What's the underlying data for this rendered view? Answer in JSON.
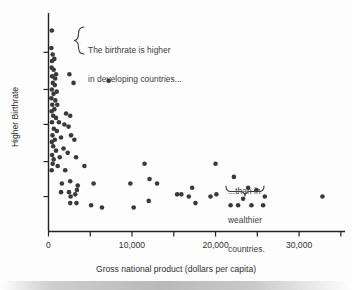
{
  "chart_data": {
    "type": "scatter",
    "title": "",
    "xlabel": "Gross national product (dollars per capita)",
    "ylabel": "Higher Birthrate",
    "xlim": [
      0,
      35500
    ],
    "ylim": [
      0,
      100
    ],
    "grid": false,
    "legend": null,
    "xticks": [
      {
        "value": 0,
        "label": "0"
      },
      {
        "value": 5000,
        "label": ""
      },
      {
        "value": 10000,
        "label": "10,000"
      },
      {
        "value": 15000,
        "label": ""
      },
      {
        "value": 20000,
        "label": "20,000"
      },
      {
        "value": 25000,
        "label": ""
      },
      {
        "value": 30000,
        "label": "30,000"
      },
      {
        "value": 35000,
        "label": ""
      }
    ],
    "yticks": [
      {
        "value": 16,
        "label": ""
      },
      {
        "value": 32,
        "label": ""
      },
      {
        "value": 49,
        "label": ""
      },
      {
        "value": 65,
        "label": ""
      },
      {
        "value": 82,
        "label": ""
      }
    ],
    "marker_color": "#3a3a3a",
    "marker_size": 4.6,
    "points": [
      {
        "x": 400,
        "y": 92
      },
      {
        "x": 350,
        "y": 84
      },
      {
        "x": 500,
        "y": 81
      },
      {
        "x": 420,
        "y": 78
      },
      {
        "x": 700,
        "y": 79
      },
      {
        "x": 380,
        "y": 75
      },
      {
        "x": 620,
        "y": 74
      },
      {
        "x": 900,
        "y": 72
      },
      {
        "x": 430,
        "y": 71
      },
      {
        "x": 800,
        "y": 70
      },
      {
        "x": 2500,
        "y": 72
      },
      {
        "x": 520,
        "y": 68
      },
      {
        "x": 760,
        "y": 67
      },
      {
        "x": 400,
        "y": 65
      },
      {
        "x": 980,
        "y": 64
      },
      {
        "x": 3000,
        "y": 68
      },
      {
        "x": 7200,
        "y": 69
      },
      {
        "x": 600,
        "y": 63
      },
      {
        "x": 350,
        "y": 61
      },
      {
        "x": 820,
        "y": 60
      },
      {
        "x": 450,
        "y": 58
      },
      {
        "x": 1050,
        "y": 58
      },
      {
        "x": 700,
        "y": 56
      },
      {
        "x": 380,
        "y": 55
      },
      {
        "x": 560,
        "y": 53
      },
      {
        "x": 900,
        "y": 52
      },
      {
        "x": 2100,
        "y": 54
      },
      {
        "x": 2600,
        "y": 53
      },
      {
        "x": 420,
        "y": 50
      },
      {
        "x": 1250,
        "y": 50
      },
      {
        "x": 1900,
        "y": 49
      },
      {
        "x": 2400,
        "y": 48
      },
      {
        "x": 640,
        "y": 47
      },
      {
        "x": 1000,
        "y": 46
      },
      {
        "x": 480,
        "y": 44
      },
      {
        "x": 1500,
        "y": 43
      },
      {
        "x": 760,
        "y": 42
      },
      {
        "x": 400,
        "y": 41
      },
      {
        "x": 2700,
        "y": 44
      },
      {
        "x": 3100,
        "y": 42
      },
      {
        "x": 560,
        "y": 39
      },
      {
        "x": 1800,
        "y": 38
      },
      {
        "x": 900,
        "y": 37
      },
      {
        "x": 2300,
        "y": 36
      },
      {
        "x": 430,
        "y": 35
      },
      {
        "x": 1350,
        "y": 34
      },
      {
        "x": 620,
        "y": 33
      },
      {
        "x": 3300,
        "y": 34
      },
      {
        "x": 500,
        "y": 31
      },
      {
        "x": 1100,
        "y": 30
      },
      {
        "x": 380,
        "y": 28
      },
      {
        "x": 2000,
        "y": 28
      },
      {
        "x": 4300,
        "y": 30
      },
      {
        "x": 11500,
        "y": 31
      },
      {
        "x": 20000,
        "y": 31
      },
      {
        "x": 1600,
        "y": 22
      },
      {
        "x": 2600,
        "y": 23
      },
      {
        "x": 3500,
        "y": 21
      },
      {
        "x": 5400,
        "y": 22
      },
      {
        "x": 9800,
        "y": 22
      },
      {
        "x": 12100,
        "y": 24
      },
      {
        "x": 13000,
        "y": 22
      },
      {
        "x": 22200,
        "y": 25
      },
      {
        "x": 1500,
        "y": 18
      },
      {
        "x": 2450,
        "y": 18
      },
      {
        "x": 2650,
        "y": 16
      },
      {
        "x": 3200,
        "y": 17
      },
      {
        "x": 3400,
        "y": 19
      },
      {
        "x": 17200,
        "y": 20
      },
      {
        "x": 23900,
        "y": 20
      },
      {
        "x": 24900,
        "y": 19
      },
      {
        "x": 15400,
        "y": 17
      },
      {
        "x": 15900,
        "y": 17
      },
      {
        "x": 16800,
        "y": 16
      },
      {
        "x": 19400,
        "y": 16
      },
      {
        "x": 20100,
        "y": 17
      },
      {
        "x": 23300,
        "y": 15
      },
      {
        "x": 25900,
        "y": 16
      },
      {
        "x": 32800,
        "y": 16
      },
      {
        "x": 2600,
        "y": 13
      },
      {
        "x": 3350,
        "y": 13
      },
      {
        "x": 5100,
        "y": 12
      },
      {
        "x": 6400,
        "y": 11
      },
      {
        "x": 10200,
        "y": 11
      },
      {
        "x": 12000,
        "y": 14
      },
      {
        "x": 17600,
        "y": 13
      },
      {
        "x": 21800,
        "y": 12
      },
      {
        "x": 22700,
        "y": 12
      },
      {
        "x": 24300,
        "y": 12
      },
      {
        "x": 25700,
        "y": 12
      }
    ],
    "annotations": [
      {
        "name": "developing-countries-note",
        "lines": [
          "The birthrate is higher",
          "in developing countries..."
        ],
        "brace": "left"
      },
      {
        "name": "wealthier-countries-note",
        "lines": [
          "...than in",
          "wealthier",
          "countries."
        ],
        "brace": "down"
      }
    ]
  },
  "axes": {
    "x_title": "Gross national product (dollars per capita)",
    "y_title": "Higher Birthrate",
    "x_tick_labels": [
      "0",
      "10,000",
      "20,000",
      "30,000"
    ]
  },
  "annotations": {
    "developing": {
      "line1": "The birthrate is higher",
      "line2": "in developing countries..."
    },
    "wealthier": {
      "line1": "...than in",
      "line2": "wealthier",
      "line3": "countries."
    }
  },
  "colors": {
    "marker": "#3a3a3a",
    "axis": "#222222",
    "text": "#2f2f2f",
    "plot_bg": "#fdfdfd"
  }
}
